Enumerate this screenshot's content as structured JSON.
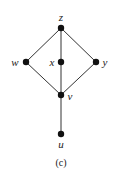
{
  "diagram": {
    "type": "hasse-diagram",
    "caption": "(c)",
    "colors": {
      "edge": "#333333",
      "node": "#111111",
      "text": "#222222",
      "background": "#ffffff"
    },
    "nodes": [
      {
        "id": "z",
        "label": "z",
        "x": 61,
        "y": 28,
        "label_x": 61,
        "label_y": 21,
        "anchor": "middle"
      },
      {
        "id": "w",
        "label": "w",
        "x": 26,
        "y": 62,
        "label_x": 15,
        "label_y": 66,
        "anchor": "middle"
      },
      {
        "id": "x",
        "label": "x",
        "x": 61,
        "y": 62,
        "label_x": 52,
        "label_y": 66,
        "anchor": "middle"
      },
      {
        "id": "y",
        "label": "y",
        "x": 96,
        "y": 62,
        "label_x": 105,
        "label_y": 66,
        "anchor": "middle"
      },
      {
        "id": "v",
        "label": "v",
        "x": 61,
        "y": 95,
        "label_x": 70,
        "label_y": 100,
        "anchor": "middle"
      },
      {
        "id": "u",
        "label": "u",
        "x": 61,
        "y": 134,
        "label_x": 61,
        "label_y": 148,
        "anchor": "middle"
      }
    ],
    "edges": [
      {
        "from": "z",
        "to": "w"
      },
      {
        "from": "z",
        "to": "x"
      },
      {
        "from": "z",
        "to": "y"
      },
      {
        "from": "w",
        "to": "v"
      },
      {
        "from": "x",
        "to": "v"
      },
      {
        "from": "y",
        "to": "v"
      },
      {
        "from": "v",
        "to": "u"
      }
    ]
  }
}
